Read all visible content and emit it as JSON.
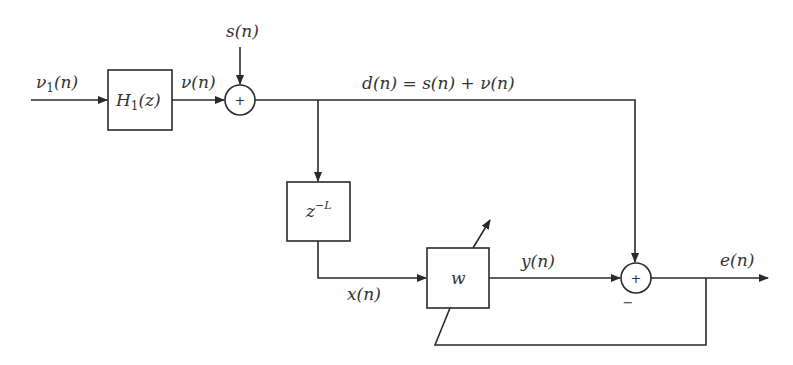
{
  "diagram": {
    "type": "adaptive-line-enhancer block diagram",
    "blocks": {
      "h1": {
        "label": "H",
        "sub": "1",
        "arg": "(z)"
      },
      "delay": {
        "label": "z",
        "sup": "−L"
      },
      "adaptive": {
        "label": "w"
      }
    },
    "junctions": {
      "sum1": {
        "sign": "+"
      },
      "sum2": {
        "sign": "+",
        "minus": "−"
      }
    },
    "signals": {
      "v1": {
        "base": "ν",
        "sub": "1",
        "arg": "(n)"
      },
      "v": "ν(n)",
      "s": "s(n)",
      "d": "d(n) = s(n) + ν(n)",
      "x": "x(n)",
      "y": "y(n)",
      "e": "e(n)"
    },
    "colors": {
      "stroke": "#2a2a2a",
      "text": "#333333",
      "background": "#ffffff"
    }
  }
}
